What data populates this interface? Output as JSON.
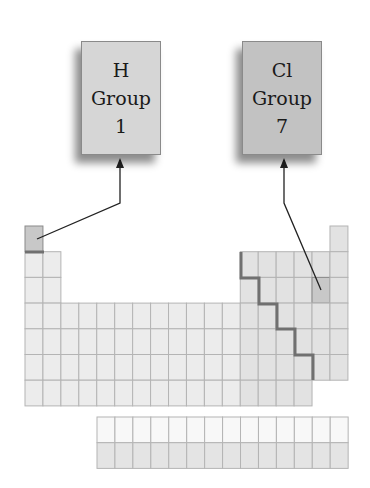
{
  "boxes": [
    {
      "id": "h",
      "symbol": "H",
      "group_word": "Group",
      "group_number": "1",
      "fill": "#d6d6d6"
    },
    {
      "id": "cl",
      "symbol": "Cl",
      "group_word": "Group",
      "group_number": "7",
      "fill": "#c2c2c2"
    }
  ],
  "periodic_table": {
    "main_rows": 7,
    "main_columns": 18,
    "f_block_rows": 2,
    "f_block_columns": 14,
    "highlighted_cells": [
      {
        "element": "H",
        "row": 1,
        "column": 1
      },
      {
        "element": "Cl",
        "row": 3,
        "column": 17
      }
    ],
    "colors": {
      "cell_fill": "#ececec",
      "p_block_fill": "#e2e2e2",
      "highlight_fill": "#c8c8c8",
      "grid_line": "#b4b4b4",
      "staircase": "#707070",
      "lanthanide_fill": "#f8f8f8",
      "actinide_fill": "#e4e4e4"
    }
  },
  "arrows": [
    {
      "from": "H cell",
      "to": "H box"
    },
    {
      "from": "Cl cell",
      "to": "Cl box"
    }
  ]
}
